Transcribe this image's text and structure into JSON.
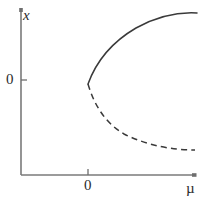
{
  "figure": {
    "kind": "bifurcation-diagram",
    "background_color": "#ffffff",
    "width": 205,
    "height": 202
  },
  "labels": {
    "y_axis_variable": "x",
    "y_axis_zero": "0",
    "x_axis_zero": "0",
    "x_axis_variable": "µ"
  },
  "colors": {
    "axis": "#7a7a7a",
    "curve": "#3a3a3a",
    "text": "#2b2b2b",
    "background": "#ffffff"
  },
  "chart_data": {
    "type": "line",
    "title": "",
    "subtitle": "",
    "xlabel": "µ",
    "ylabel": "x",
    "xlim": [
      -1.1,
      3.0
    ],
    "ylim": [
      -2.2,
      1.85
    ],
    "grid": false,
    "legend": null,
    "x_ticks": [
      {
        "value": 0,
        "label": "0"
      }
    ],
    "y_ticks": [
      {
        "value": 0,
        "label": "0"
      }
    ],
    "annotations": [
      {
        "text": "bifurcation point",
        "x": 0,
        "y": -0.1,
        "shown": false
      }
    ],
    "series": [
      {
        "name": "upper branch (stable)",
        "style": "solid",
        "color": "#3a3a3a",
        "x": [
          0.0,
          0.08,
          0.2,
          0.36,
          0.56,
          0.8,
          1.08,
          1.4,
          1.76,
          2.16,
          2.6,
          3.0
        ],
        "y": [
          -0.1,
          0.22,
          0.46,
          0.7,
          0.92,
          1.1,
          1.26,
          1.4,
          1.52,
          1.62,
          1.7,
          1.75
        ]
      },
      {
        "name": "lower branch (unstable)",
        "style": "dashed",
        "color": "#3a3a3a",
        "x": [
          0.0,
          0.08,
          0.2,
          0.36,
          0.56,
          0.8,
          1.08,
          1.4,
          1.76,
          2.16,
          2.6,
          2.95
        ],
        "y": [
          -0.1,
          -0.38,
          -0.62,
          -0.86,
          -1.08,
          -1.28,
          -1.46,
          -1.62,
          -1.76,
          -1.88,
          -1.97,
          -2.02
        ]
      }
    ],
    "curve_geometry_px": {
      "note": "pixel-space control points used for rendering",
      "origin_px": {
        "x": 21,
        "y": 175
      },
      "bifurcation_px": {
        "x": 88,
        "y": 84
      },
      "zero_y_px": 80,
      "zero_x_px": 88,
      "upper_path": "M 88 84 C 96 62, 112 42, 136 28 C 158 16, 180 12, 197 13",
      "lower_path": "M 88 84 C 94 104, 104 122, 124 134 C 148 146, 174 150, 195 150"
    }
  }
}
